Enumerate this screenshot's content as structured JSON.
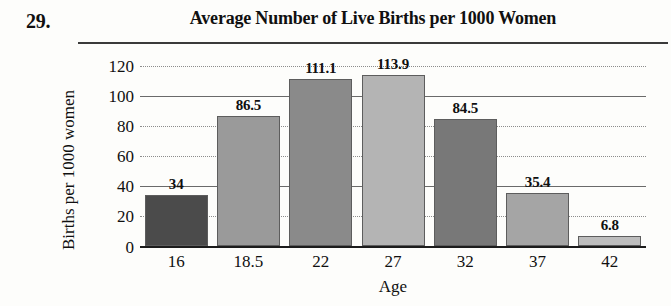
{
  "question_number": "29.",
  "chart_data": {
    "type": "bar",
    "title": "Average Number of Live Births per 1000 Women",
    "xlabel": "Age",
    "ylabel": "Births per 1000 women",
    "categories": [
      "16",
      "18.5",
      "22",
      "27",
      "32",
      "37",
      "42"
    ],
    "values": [
      34,
      86.5,
      111.1,
      113.9,
      84.5,
      35.4,
      6.8
    ],
    "value_labels": [
      "34",
      "86.5",
      "111.1",
      "113.9",
      "84.5",
      "35.4",
      "6.8"
    ],
    "bar_colors": [
      "#4b4b4b",
      "#9a9a9a",
      "#8a8a8a",
      "#b4b4b4",
      "#787878",
      "#a5a5a5",
      "#bdbdbd"
    ],
    "ylim": [
      0,
      120
    ],
    "yticks": [
      0,
      20,
      40,
      60,
      80,
      100,
      120
    ],
    "ytick_labels": [
      "0",
      "20",
      "40",
      "60",
      "80",
      "100",
      "120"
    ],
    "gridline_style": [
      "solid",
      "dotted",
      "solid",
      "dotted",
      "dotted",
      "solid",
      "dotted"
    ],
    "grid": true,
    "legend": "none"
  }
}
